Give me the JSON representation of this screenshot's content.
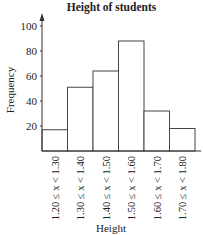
{
  "chart_data": {
    "type": "bar",
    "title": "Height of students",
    "xlabel": "Height",
    "ylabel": "Frequency",
    "categories": [
      "1.20 ≤ x < 1.30",
      "1.30 ≤ x < 1.40",
      "1.40 ≤ x < 1.50",
      "1.50 ≤ x < 1.60",
      "1.60 ≤ x < 1.70",
      "1.70 ≤ x < 1.80"
    ],
    "values": [
      17,
      51,
      64,
      88,
      32,
      18
    ],
    "yticks": [
      20,
      40,
      60,
      80,
      100
    ],
    "ylim": [
      0,
      110
    ],
    "grid": false,
    "legend": null
  },
  "colors": {
    "bar_fill": "#ffffff",
    "bar_stroke": "#444444",
    "axis": "#333333"
  }
}
